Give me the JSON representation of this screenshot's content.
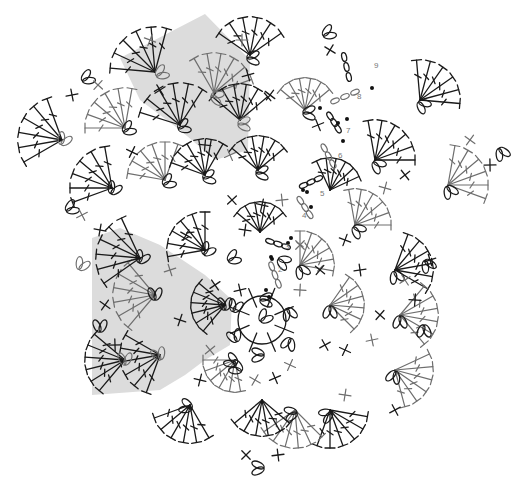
{
  "diagram": {
    "title": "",
    "type": "crochet-chart",
    "center": [
      262,
      320
    ],
    "colors": {
      "background": "#ffffff",
      "shade": "#dcdcdc",
      "dark_stitch": "#1a1a1a",
      "gray_stitch": "#6e6e6e",
      "marker_dot": "#111111",
      "round_label": "#777777"
    },
    "legend_symbols": [
      {
        "name": "double-crochet-fan",
        "glyph": "T"
      },
      {
        "name": "chain-loop",
        "glyph": "0"
      },
      {
        "name": "single-crochet",
        "glyph": "×"
      },
      {
        "name": "round-start-marker",
        "glyph": "•"
      }
    ],
    "shaded_regions": [
      {
        "name": "top-left-sector",
        "points": "120,58 205,14 250,60 248,150 215,160 180,130 140,100"
      },
      {
        "name": "left-sector",
        "points": "92,238 120,228 160,245 205,275 232,300 230,345 205,360 185,375 160,390 92,395"
      }
    ],
    "round_labels": [
      {
        "text": "2",
        "x": 278,
        "y": 272
      },
      {
        "text": "3",
        "x": 285,
        "y": 249
      },
      {
        "text": "4",
        "x": 302,
        "y": 218
      },
      {
        "text": "5",
        "x": 320,
        "y": 196
      },
      {
        "text": "6",
        "x": 338,
        "y": 158
      },
      {
        "text": "7",
        "x": 346,
        "y": 133
      },
      {
        "text": "8",
        "x": 357,
        "y": 99
      },
      {
        "text": "9",
        "x": 374,
        "y": 68
      }
    ],
    "markers": [
      {
        "x": 269,
        "y": 297
      },
      {
        "x": 272,
        "y": 259
      },
      {
        "x": 288,
        "y": 243
      },
      {
        "x": 291,
        "y": 238
      },
      {
        "x": 311,
        "y": 207
      },
      {
        "x": 303,
        "y": 190
      },
      {
        "x": 338,
        "y": 123
      },
      {
        "x": 347,
        "y": 119
      },
      {
        "x": 343,
        "y": 141
      },
      {
        "x": 320,
        "y": 108
      },
      {
        "x": 372,
        "y": 88
      },
      {
        "x": 307,
        "y": 192
      },
      {
        "x": 271,
        "y": 257
      },
      {
        "x": 266,
        "y": 290
      }
    ],
    "fans": [
      {
        "x": 250,
        "y": 55,
        "angle": -90,
        "r": 38,
        "spread": 110,
        "tone": "dark"
      },
      {
        "x": 155,
        "y": 72,
        "angle": -125,
        "r": 45,
        "spread": 100,
        "tone": "dark"
      },
      {
        "x": 180,
        "y": 125,
        "angle": -110,
        "r": 42,
        "spread": 105,
        "tone": "dark"
      },
      {
        "x": 214,
        "y": 93,
        "angle": -70,
        "r": 40,
        "spread": 100,
        "tone": "gray"
      },
      {
        "x": 240,
        "y": 120,
        "angle": -90,
        "r": 36,
        "spread": 100,
        "tone": "dark"
      },
      {
        "x": 62,
        "y": 140,
        "angle": -160,
        "r": 44,
        "spread": 100,
        "tone": "dark"
      },
      {
        "x": 125,
        "y": 128,
        "angle": -130,
        "r": 40,
        "spread": 100,
        "tone": "gray"
      },
      {
        "x": 112,
        "y": 188,
        "angle": -150,
        "r": 42,
        "spread": 100,
        "tone": "dark"
      },
      {
        "x": 165,
        "y": 180,
        "angle": -120,
        "r": 38,
        "spread": 100,
        "tone": "gray"
      },
      {
        "x": 205,
        "y": 175,
        "angle": -110,
        "r": 36,
        "spread": 100,
        "tone": "dark"
      },
      {
        "x": 258,
        "y": 170,
        "angle": -90,
        "r": 34,
        "spread": 100,
        "tone": "dark"
      },
      {
        "x": 305,
        "y": 110,
        "angle": -90,
        "r": 32,
        "spread": 100,
        "tone": "gray"
      },
      {
        "x": 420,
        "y": 100,
        "angle": -45,
        "r": 40,
        "spread": 100,
        "tone": "dark"
      },
      {
        "x": 375,
        "y": 160,
        "angle": -50,
        "r": 40,
        "spread": 100,
        "tone": "dark"
      },
      {
        "x": 448,
        "y": 185,
        "angle": -30,
        "r": 40,
        "spread": 100,
        "tone": "gray"
      },
      {
        "x": 355,
        "y": 225,
        "angle": -50,
        "r": 36,
        "spread": 100,
        "tone": "gray"
      },
      {
        "x": 330,
        "y": 190,
        "angle": -70,
        "r": 32,
        "spread": 90,
        "tone": "dark"
      },
      {
        "x": 260,
        "y": 232,
        "angle": -90,
        "r": 30,
        "spread": 100,
        "tone": "dark"
      },
      {
        "x": 395,
        "y": 270,
        "angle": -20,
        "r": 38,
        "spread": 100,
        "tone": "dark"
      },
      {
        "x": 400,
        "y": 315,
        "angle": 0,
        "r": 38,
        "spread": 100,
        "tone": "gray"
      },
      {
        "x": 395,
        "y": 370,
        "angle": 25,
        "r": 38,
        "spread": 100,
        "tone": "gray"
      },
      {
        "x": 330,
        "y": 410,
        "angle": 60,
        "r": 38,
        "spread": 100,
        "tone": "dark"
      },
      {
        "x": 295,
        "y": 410,
        "angle": 95,
        "r": 38,
        "spread": 100,
        "tone": "gray"
      },
      {
        "x": 262,
        "y": 400,
        "angle": 90,
        "r": 36,
        "spread": 100,
        "tone": "dark"
      },
      {
        "x": 190,
        "y": 405,
        "angle": 110,
        "r": 38,
        "spread": 100,
        "tone": "dark"
      },
      {
        "x": 160,
        "y": 355,
        "angle": 160,
        "r": 40,
        "spread": 100,
        "tone": "dark"
      },
      {
        "x": 125,
        "y": 360,
        "angle": 175,
        "r": 40,
        "spread": 90,
        "tone": "dark"
      },
      {
        "x": 155,
        "y": 295,
        "angle": 180,
        "r": 42,
        "spread": 100,
        "tone": "gray"
      },
      {
        "x": 140,
        "y": 258,
        "angle": -165,
        "r": 44,
        "spread": 100,
        "tone": "dark"
      },
      {
        "x": 205,
        "y": 250,
        "angle": -140,
        "r": 38,
        "spread": 100,
        "tone": "dark"
      },
      {
        "x": 225,
        "y": 305,
        "angle": 175,
        "r": 34,
        "spread": 90,
        "tone": "dark"
      },
      {
        "x": 300,
        "y": 265,
        "angle": -40,
        "r": 34,
        "spread": 100,
        "tone": "gray"
      },
      {
        "x": 330,
        "y": 305,
        "angle": -5,
        "r": 34,
        "spread": 100,
        "tone": "gray"
      },
      {
        "x": 235,
        "y": 360,
        "angle": 130,
        "r": 32,
        "spread": 100,
        "tone": "gray"
      }
    ],
    "loops": [
      {
        "x": 249,
        "y": 58,
        "angle": 90,
        "tone": "dark"
      },
      {
        "x": 158,
        "y": 75,
        "angle": 60,
        "tone": "gray"
      },
      {
        "x": 180,
        "y": 128,
        "angle": 70,
        "tone": "dark"
      },
      {
        "x": 213,
        "y": 96,
        "angle": 110,
        "tone": "gray"
      },
      {
        "x": 240,
        "y": 124,
        "angle": 90,
        "tone": "gray"
      },
      {
        "x": 84,
        "y": 80,
        "angle": 60,
        "tone": "dark"
      },
      {
        "x": 62,
        "y": 143,
        "angle": 30,
        "tone": "gray"
      },
      {
        "x": 125,
        "y": 131,
        "angle": 60,
        "tone": "dark"
      },
      {
        "x": 68,
        "y": 210,
        "angle": 60,
        "tone": "dark"
      },
      {
        "x": 112,
        "y": 192,
        "angle": 30,
        "tone": "dark"
      },
      {
        "x": 165,
        "y": 184,
        "angle": 60,
        "tone": "dark"
      },
      {
        "x": 205,
        "y": 178,
        "angle": 80,
        "tone": "dark"
      },
      {
        "x": 258,
        "y": 173,
        "angle": 90,
        "tone": "dark"
      },
      {
        "x": 305,
        "y": 113,
        "angle": 90,
        "tone": "dark"
      },
      {
        "x": 325,
        "y": 35,
        "angle": 60,
        "tone": "dark"
      },
      {
        "x": 420,
        "y": 103,
        "angle": 130,
        "tone": "dark"
      },
      {
        "x": 375,
        "y": 163,
        "angle": 130,
        "tone": "dark"
      },
      {
        "x": 448,
        "y": 188,
        "angle": 150,
        "tone": "dark"
      },
      {
        "x": 500,
        "y": 150,
        "angle": 150,
        "tone": "dark"
      },
      {
        "x": 355,
        "y": 228,
        "angle": 130,
        "tone": "dark"
      },
      {
        "x": 395,
        "y": 273,
        "angle": 160,
        "tone": "dark"
      },
      {
        "x": 426,
        "y": 262,
        "angle": 150,
        "tone": "dark"
      },
      {
        "x": 400,
        "y": 318,
        "angle": 180,
        "tone": "dark"
      },
      {
        "x": 424,
        "y": 327,
        "angle": 180,
        "tone": "dark"
      },
      {
        "x": 395,
        "y": 373,
        "angle": 200,
        "tone": "dark"
      },
      {
        "x": 330,
        "y": 413,
        "angle": 240,
        "tone": "dark"
      },
      {
        "x": 295,
        "y": 413,
        "angle": 260,
        "tone": "dark"
      },
      {
        "x": 262,
        "y": 468,
        "angle": 270,
        "tone": "dark"
      },
      {
        "x": 190,
        "y": 408,
        "angle": 290,
        "tone": "dark"
      },
      {
        "x": 160,
        "y": 358,
        "angle": 340,
        "tone": "gray"
      },
      {
        "x": 125,
        "y": 363,
        "angle": 0,
        "tone": "gray"
      },
      {
        "x": 100,
        "y": 330,
        "angle": 0,
        "tone": "dark"
      },
      {
        "x": 155,
        "y": 298,
        "angle": 0,
        "tone": "dark"
      },
      {
        "x": 140,
        "y": 261,
        "angle": 30,
        "tone": "dark"
      },
      {
        "x": 80,
        "y": 268,
        "angle": 30,
        "tone": "gray"
      },
      {
        "x": 205,
        "y": 253,
        "angle": 40,
        "tone": "dark"
      },
      {
        "x": 225,
        "y": 308,
        "angle": 0,
        "tone": "dark"
      },
      {
        "x": 300,
        "y": 268,
        "angle": 150,
        "tone": "dark"
      },
      {
        "x": 330,
        "y": 308,
        "angle": 180,
        "tone": "dark"
      },
      {
        "x": 235,
        "y": 363,
        "angle": 300,
        "tone": "dark"
      },
      {
        "x": 262,
        "y": 300,
        "angle": 90,
        "tone": "dark"
      },
      {
        "x": 288,
        "y": 310,
        "angle": 160,
        "tone": "dark"
      },
      {
        "x": 290,
        "y": 340,
        "angle": 200,
        "tone": "dark"
      },
      {
        "x": 262,
        "y": 355,
        "angle": 270,
        "tone": "dark"
      },
      {
        "x": 236,
        "y": 340,
        "angle": 340,
        "tone": "dark"
      },
      {
        "x": 234,
        "y": 310,
        "angle": 20,
        "tone": "dark"
      },
      {
        "x": 262,
        "y": 320,
        "angle": 45,
        "tone": "dark"
      },
      {
        "x": 240,
        "y": 370,
        "angle": 300,
        "tone": "dark"
      },
      {
        "x": 230,
        "y": 260,
        "angle": 60,
        "tone": "dark"
      },
      {
        "x": 280,
        "y": 260,
        "angle": 120,
        "tone": "dark"
      }
    ],
    "chains": [
      {
        "x1": 270,
        "y1": 262,
        "x2": 280,
        "y2": 288,
        "tone": "gray"
      },
      {
        "x1": 266,
        "y1": 240,
        "x2": 290,
        "y2": 248,
        "tone": "dark"
      },
      {
        "x1": 298,
        "y1": 197,
        "x2": 312,
        "y2": 218,
        "tone": "gray"
      },
      {
        "x1": 300,
        "y1": 187,
        "x2": 322,
        "y2": 177,
        "tone": "dark"
      },
      {
        "x1": 322,
        "y1": 144,
        "x2": 335,
        "y2": 168,
        "tone": "gray"
      },
      {
        "x1": 328,
        "y1": 113,
        "x2": 340,
        "y2": 132,
        "tone": "dark"
      },
      {
        "x1": 330,
        "y1": 103,
        "x2": 360,
        "y2": 90,
        "tone": "gray"
      },
      {
        "x1": 343,
        "y1": 52,
        "x2": 350,
        "y2": 82,
        "tone": "dark"
      }
    ],
    "crosses": [
      {
        "x": 242,
        "y": 40
      },
      {
        "x": 270,
        "y": 95
      },
      {
        "x": 248,
        "y": 75
      },
      {
        "x": 150,
        "y": 40
      },
      {
        "x": 160,
        "y": 90
      },
      {
        "x": 205,
        "y": 145
      },
      {
        "x": 98,
        "y": 85
      },
      {
        "x": 72,
        "y": 95
      },
      {
        "x": 132,
        "y": 152
      },
      {
        "x": 82,
        "y": 215
      },
      {
        "x": 100,
        "y": 230
      },
      {
        "x": 232,
        "y": 200
      },
      {
        "x": 282,
        "y": 200
      },
      {
        "x": 330,
        "y": 50
      },
      {
        "x": 318,
        "y": 125
      },
      {
        "x": 385,
        "y": 188
      },
      {
        "x": 405,
        "y": 175
      },
      {
        "x": 490,
        "y": 165
      },
      {
        "x": 470,
        "y": 140
      },
      {
        "x": 430,
        "y": 260
      },
      {
        "x": 345,
        "y": 240
      },
      {
        "x": 405,
        "y": 280
      },
      {
        "x": 415,
        "y": 300
      },
      {
        "x": 380,
        "y": 315
      },
      {
        "x": 372,
        "y": 340
      },
      {
        "x": 345,
        "y": 350
      },
      {
        "x": 395,
        "y": 410
      },
      {
        "x": 345,
        "y": 395
      },
      {
        "x": 246,
        "y": 455
      },
      {
        "x": 278,
        "y": 455
      },
      {
        "x": 255,
        "y": 380
      },
      {
        "x": 275,
        "y": 378
      },
      {
        "x": 200,
        "y": 380
      },
      {
        "x": 210,
        "y": 350
      },
      {
        "x": 115,
        "y": 345
      },
      {
        "x": 105,
        "y": 305
      },
      {
        "x": 170,
        "y": 270
      },
      {
        "x": 180,
        "y": 320
      },
      {
        "x": 215,
        "y": 285
      },
      {
        "x": 300,
        "y": 290
      },
      {
        "x": 320,
        "y": 270
      },
      {
        "x": 240,
        "y": 290
      },
      {
        "x": 290,
        "y": 365
      },
      {
        "x": 325,
        "y": 345
      },
      {
        "x": 245,
        "y": 230
      },
      {
        "x": 300,
        "y": 245
      },
      {
        "x": 360,
        "y": 270
      },
      {
        "x": 186,
        "y": 235
      },
      {
        "x": 230,
        "y": 155
      },
      {
        "x": 262,
        "y": 205
      }
    ]
  }
}
